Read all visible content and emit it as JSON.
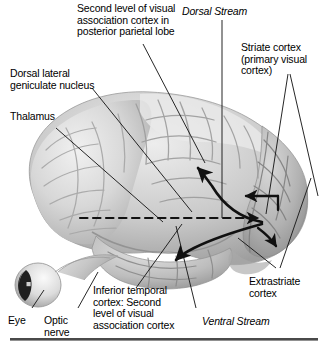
{
  "figure": {
    "background_color": "#ffffff",
    "text_color": "#000000",
    "line_color": "#1a1a1a",
    "brain_tone_light": "#e9e9e9",
    "brain_tone_mid": "#bdbdbd",
    "brain_tone_dark": "#8a8a8a"
  },
  "labels": {
    "parietal": {
      "lines": [
        "Second level of visual",
        "association cortex in",
        "posterior parietal lobe"
      ],
      "text": "Second level of visual\nassociation cortex in\nposterior parietal lobe",
      "style": "plain"
    },
    "lgn": {
      "lines": [
        "Dorsal lateral",
        "geniculate nucleus"
      ],
      "text": "Dorsal lateral\ngeniculate nucleus",
      "style": "plain"
    },
    "thalamus": {
      "text": "Thalamus",
      "style": "plain"
    },
    "dorsal_stream": {
      "text": "Dorsal Stream",
      "style": "italic"
    },
    "striate": {
      "lines": [
        "Striate cortex",
        "(primary visual",
        "cortex)"
      ],
      "text": "Striate cortex\n(primary visual\ncortex)",
      "style": "plain"
    },
    "extrastriate": {
      "lines": [
        "Extrastriate",
        "cortex"
      ],
      "text": "Extrastriate\ncortex",
      "style": "plain"
    },
    "inferior_temporal": {
      "lines": [
        "Inferior temporal",
        "cortex: Second",
        "level of visual",
        "association cortex"
      ],
      "text": "Inferior temporal\ncortex: Second\nlevel of visual\nassociation cortex",
      "style": "plain"
    },
    "ventral_stream": {
      "text": "Ventral Stream",
      "style": "italic"
    },
    "eye": {
      "text": "Eye",
      "style": "plain"
    },
    "optic_nerve": {
      "lines": [
        "Optic",
        "nerve"
      ],
      "text": "Optic\nnerve",
      "style": "plain"
    }
  },
  "anatomy": {
    "structures": [
      "brain lateral view",
      "eyeball",
      "optic nerve"
    ],
    "arrows": [
      {
        "name": "lgn-to-striate",
        "style": "dashed",
        "direction": "left-to-right"
      },
      {
        "name": "striate-to-parietal-dorsal",
        "style": "solid-curved",
        "direction": "up-left"
      },
      {
        "name": "striate-to-temporal-ventral",
        "style": "solid-curved",
        "direction": "down-left"
      },
      {
        "name": "extrastriate-feedback-upper",
        "style": "solid",
        "direction": "right-to-left"
      },
      {
        "name": "extrastriate-to-striate",
        "style": "solid",
        "direction": "left-to-right"
      },
      {
        "name": "striate-to-extrastriate-lower",
        "style": "solid-curved",
        "direction": "down-right"
      }
    ]
  }
}
